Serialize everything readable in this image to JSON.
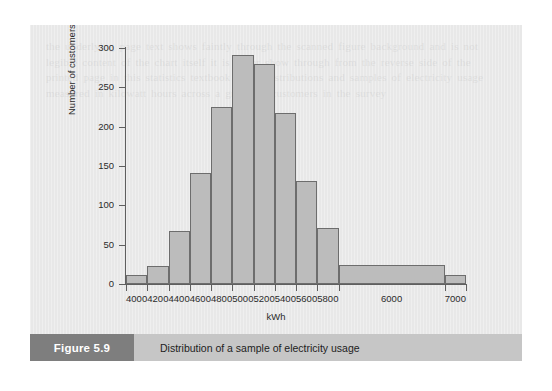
{
  "figure": {
    "number_label": "Figure 5.9",
    "caption": "Distribution of a sample of electricity usage",
    "background_color": "#e8e8e8",
    "caption_bar_color": "#c6c6c6",
    "number_box_color": "#7e7e7e"
  },
  "ghost_text": "the underlying page text shows faintly through the scanned figure background and is not legible content of the chart itself it is paper show through from the reverse side of the printed page in this statistics textbook about distributions and samples of electricity usage measured in kilowatt hours across a group of customers in the survey",
  "chart_data": {
    "type": "bar",
    "title": "",
    "xlabel": "kWh",
    "ylabel": "Number of customers",
    "categories": [
      "4000",
      "4200",
      "4400",
      "4600",
      "4800",
      "5000",
      "5200",
      "5400",
      "5600",
      "5800",
      "6000",
      "7000"
    ],
    "values": [
      11,
      23,
      68,
      141,
      225,
      291,
      280,
      217,
      131,
      71,
      24,
      11
    ],
    "bin_edges": [
      3900,
      4100,
      4300,
      4500,
      4700,
      4900,
      5100,
      5300,
      5500,
      5700,
      5900,
      6900,
      7100
    ],
    "ylim": [
      0,
      300
    ],
    "yticks": [
      0,
      50,
      100,
      150,
      200,
      250,
      300
    ],
    "xlim": [
      3900,
      7100
    ],
    "grid": false,
    "legend": null,
    "bar_fill_color": "#bcbcbc",
    "bar_edge_color": "#6d6d6d"
  }
}
